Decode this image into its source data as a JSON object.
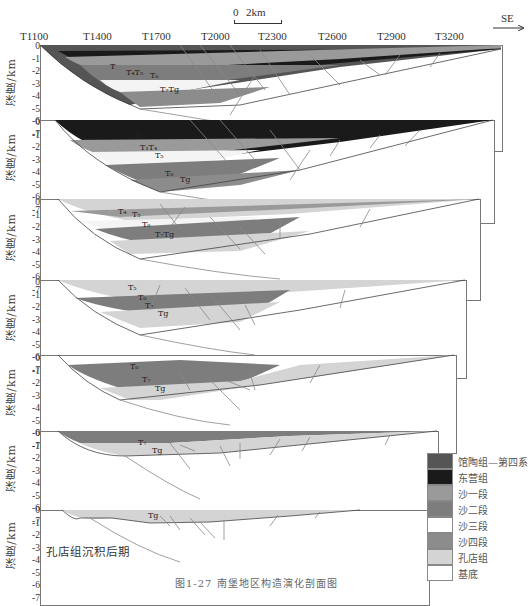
{
  "scale_bar": {
    "start": "0",
    "end": "2km"
  },
  "direction": "SE",
  "trace_labels": [
    "T1100",
    "T1400",
    "T1700",
    "T2000",
    "T2300",
    "T2600",
    "T2900",
    "T3200"
  ],
  "y_axis": {
    "label": "深度/km",
    "ticks": [
      "0",
      "-1",
      "-2",
      "-3",
      "-4",
      "-5",
      "-6",
      "-7"
    ]
  },
  "panels": [
    {
      "title": "馆陶组—第四系沉积后(现今)期",
      "horizons": [
        "T2",
        "T4",
        "T5",
        "T6",
        "T7",
        "Tg"
      ]
    },
    {
      "title": "东营组沉积后期",
      "horizons": [
        "T2",
        "T3",
        "T4",
        "T5",
        "T6",
        "T7",
        "Tg"
      ]
    },
    {
      "title": "沙一段沉积后期",
      "horizons": [
        "T4",
        "T5",
        "T6",
        "T7",
        "Tg"
      ]
    },
    {
      "title": "沙二段沉积后期",
      "horizons": [
        "T5",
        "T6",
        "T7",
        "Tg"
      ]
    },
    {
      "title": "沙三段沉积后期",
      "horizons": [
        "T6",
        "T7",
        "Tg"
      ]
    },
    {
      "title": "沙四段沉积后期",
      "horizons": [
        "T7",
        "Tg"
      ]
    },
    {
      "title": "孔店组沉积后期",
      "horizons": [
        "Tg"
      ]
    }
  ],
  "legend": [
    {
      "label": "馆陶组—第四系",
      "color": "#555555"
    },
    {
      "label": "东营组",
      "color": "#1a1a1a"
    },
    {
      "label": "沙一段",
      "color": "#9a9a9a"
    },
    {
      "label": "沙二段",
      "color": "#7d7d7d"
    },
    {
      "label": "沙三段",
      "color": "#ffffff"
    },
    {
      "label": "沙四段",
      "color": "#8c8c8c"
    },
    {
      "label": "孔店组",
      "color": "#d4d4d4"
    },
    {
      "label": "基底",
      "color": "#ffffff"
    }
  ],
  "caption": "图1-27 南堡地区构造演化剖面图",
  "colors": {
    "guantao": "#555555",
    "dongying": "#1a1a1a",
    "sha1": "#9a9a9a",
    "sha2": "#7d7d7d",
    "sha3": "#f4f4f4",
    "sha4": "#8c8c8c",
    "kongdian": "#d4d4d4",
    "fault": "#888888",
    "frame": "#777777"
  }
}
